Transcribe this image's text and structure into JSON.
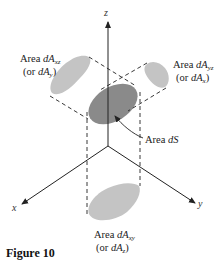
{
  "figure": {
    "caption": "Figure 10",
    "axes": {
      "x_label": "x",
      "y_label": "y",
      "z_label": "z"
    },
    "areas": {
      "xz": {
        "line1_prefix": "Area ",
        "line1_var": "dA",
        "line1_sub": "xz",
        "line2_open": "(or ",
        "line2_var": "dA",
        "line2_sub": "y",
        "line2_close": ")"
      },
      "yz": {
        "line1_prefix": "Area ",
        "line1_var": "dA",
        "line1_sub": "yz",
        "line2_open": "(or ",
        "line2_var": "dA",
        "line2_sub": "x",
        "line2_close": ")"
      },
      "xy": {
        "line1_prefix": "Area ",
        "line1_var": "dA",
        "line1_sub": "xy",
        "line2_open": "(or ",
        "line2_var": "dA",
        "line2_sub": "z",
        "line2_close": ")"
      },
      "surface": {
        "prefix": "Area ",
        "var": "dS"
      }
    },
    "colors": {
      "surface_fill": "#8a8a8a",
      "projection_fill": "#c4c4c4",
      "line": "#222222"
    }
  }
}
